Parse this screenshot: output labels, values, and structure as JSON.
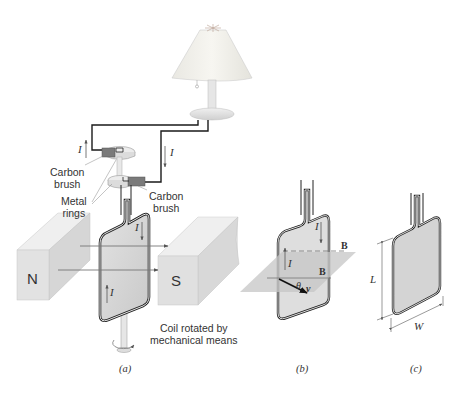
{
  "figure": {
    "panels": [
      {
        "id": "a",
        "caption": "(a)"
      },
      {
        "id": "b",
        "caption": "(b)"
      },
      {
        "id": "c",
        "caption": "(c)"
      }
    ],
    "panel_a": {
      "labels": {
        "carbon_brush_left": [
          "Carbon",
          "brush"
        ],
        "metal_rings": [
          "Metal",
          "rings"
        ],
        "carbon_brush_right": [
          "Carbon",
          "brush"
        ],
        "coil_rotated": [
          "Coil rotated by",
          "mechanical means"
        ]
      },
      "magnet_north": "N",
      "magnet_south": "S",
      "current_symbol": "I"
    },
    "panel_b": {
      "current_symbol": "I",
      "field_vector": "B",
      "angle_symbol": "θ",
      "velocity_vector": "v"
    },
    "panel_c": {
      "length_symbol": "L",
      "width_symbol": "W"
    },
    "colors": {
      "wire": "#1a1a1a",
      "coil_fill": "#d4d4d4",
      "magnet_face": "#e2e2e2",
      "magnet_side": "#cfcfcf",
      "plane": "#c8c8c8",
      "lamp_shade": "#f1f0ea",
      "arrow": "#555555"
    }
  }
}
